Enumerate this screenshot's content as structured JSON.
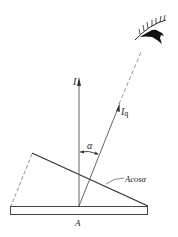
{
  "diagram": {
    "labels": {
      "intensity_normal": "I",
      "intensity_angle": "I",
      "intensity_angle_sub": "q",
      "angle": "α",
      "projected_area": "Acosα",
      "area": "A"
    },
    "elements": {
      "eye": "observer-eye-icon",
      "base_plate": "surface area A",
      "tilted_plate": "projected surface Acosα",
      "normal_arrow": "intensity I along normal",
      "viewing_arrow": "intensity Iq toward observer"
    },
    "colors": {
      "line": "#333333",
      "background": "#ffffff"
    }
  }
}
